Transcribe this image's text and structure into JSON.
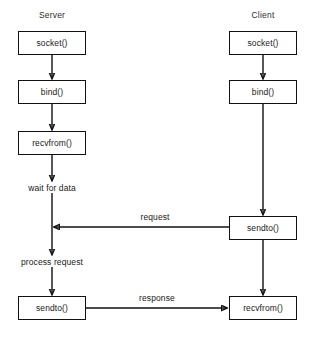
{
  "diagram": {
    "title_server": "Server",
    "title_client": "Client",
    "server_nodes": [
      {
        "id": "server-socket",
        "label": "socket()"
      },
      {
        "id": "server-bind",
        "label": "bind()"
      },
      {
        "id": "server-recvfrom",
        "label": "recvfrom()"
      },
      {
        "id": "server-sendto",
        "label": "sendto()"
      }
    ],
    "client_nodes": [
      {
        "id": "client-socket",
        "label": "socket()"
      },
      {
        "id": "client-bind",
        "label": "bind()"
      },
      {
        "id": "client-sendto",
        "label": "sendto()"
      },
      {
        "id": "client-recvfrom",
        "label": "recvfrom()"
      }
    ],
    "server_states": [
      {
        "id": "wait-for-data",
        "label": "wait for data"
      },
      {
        "id": "process-request",
        "label": "process request"
      }
    ],
    "edge_labels": [
      {
        "id": "request",
        "label": "request"
      },
      {
        "id": "response",
        "label": "response"
      }
    ],
    "colors": {
      "stroke": "#111111",
      "text": "#1a1a1a",
      "background": "#ffffff"
    }
  }
}
